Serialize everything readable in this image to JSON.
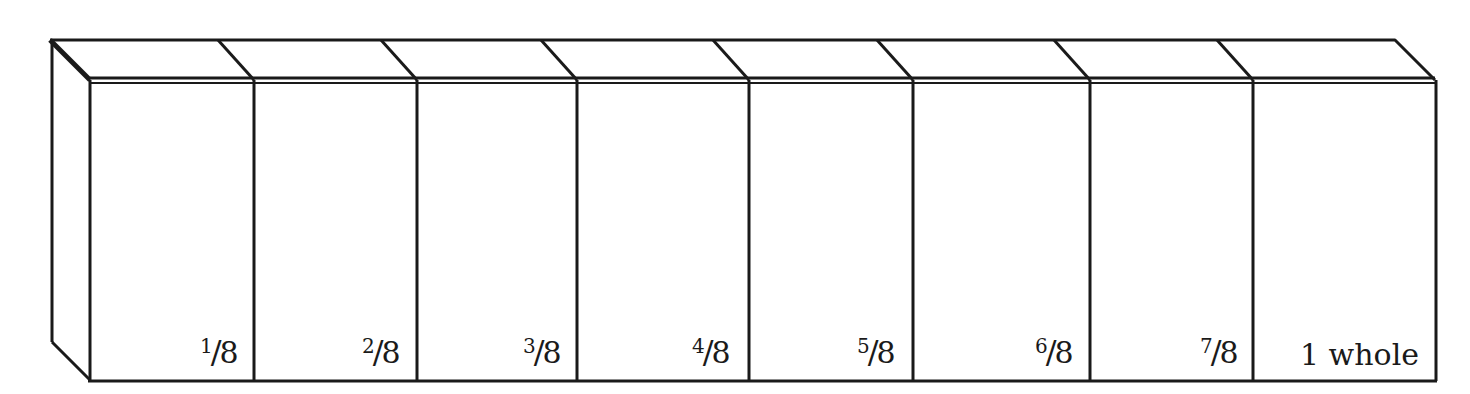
{
  "diagram": {
    "colors": {
      "stroke": "#1a1a1a",
      "fill": "#ffffff"
    },
    "box": {
      "top_y": 39,
      "front_top_y": 78,
      "bottom_y": 380,
      "left_back_x": 50,
      "left_front_x": 90,
      "right_front_x": 1435,
      "depth_dx": 40
    },
    "dividers_x": [
      254,
      417,
      577,
      749,
      913,
      1090,
      1253
    ],
    "segments": [
      {
        "label": "1⁄8",
        "num": "1",
        "den": "8",
        "label_x": 200
      },
      {
        "label": "2⁄8",
        "num": "2",
        "den": "8",
        "label_x": 362
      },
      {
        "label": "3⁄8",
        "num": "3",
        "den": "8",
        "label_x": 523
      },
      {
        "label": "4⁄8",
        "num": "4",
        "den": "8",
        "label_x": 692
      },
      {
        "label": "5⁄8",
        "num": "5",
        "den": "8",
        "label_x": 857
      },
      {
        "label": "6⁄8",
        "num": "6",
        "den": "8",
        "label_x": 1035
      },
      {
        "label": "7⁄8",
        "num": "7",
        "den": "8",
        "label_x": 1200
      },
      {
        "label": "1 whole",
        "label_x": 1300
      }
    ]
  }
}
